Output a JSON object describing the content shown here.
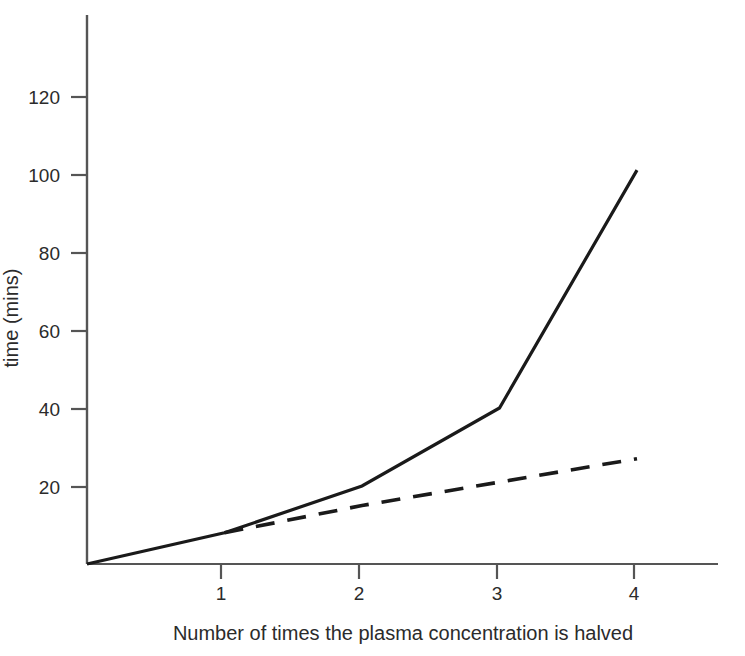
{
  "chart_data": {
    "type": "line",
    "title": "",
    "subtitle": "",
    "xlabel": "Number of times the plasma concentration is halved",
    "ylabel": "time (mins)",
    "xlim": [
      0,
      4.6
    ],
    "ylim": [
      0,
      141
    ],
    "grid": false,
    "legend": "none",
    "xticks": [
      1,
      2,
      3,
      4
    ],
    "xtick_labels": [
      "1",
      "2",
      "3",
      "4"
    ],
    "yticks": [
      20,
      40,
      60,
      80,
      100,
      120
    ],
    "ytick_labels": [
      "20",
      "40",
      "60",
      "80",
      "100",
      "120"
    ],
    "series": [
      {
        "name": "solid-curve",
        "style": "solid",
        "color": "#1a1a1a",
        "x": [
          0,
          1,
          2,
          3,
          4
        ],
        "values": [
          0,
          8,
          20,
          40,
          101
        ]
      },
      {
        "name": "dashed-curve",
        "style": "dashed",
        "color": "#1a1a1a",
        "x": [
          1,
          2,
          4
        ],
        "values": [
          8,
          15,
          27
        ]
      }
    ]
  },
  "axes": {
    "x_tick_0_label": "1",
    "x_tick_1_label": "2",
    "x_tick_2_label": "3",
    "x_tick_3_label": "4",
    "y_tick_0_label": "20",
    "y_tick_1_label": "40",
    "y_tick_2_label": "60",
    "y_tick_3_label": "80",
    "y_tick_4_label": "100",
    "y_tick_5_label": "120",
    "x_axis_title": "Number of times the plasma concentration is halved",
    "y_axis_title": "time (mins)"
  },
  "colors": {
    "background": "#ffffff",
    "axis": "#555555",
    "line": "#1a1a1a",
    "text": "#2b2b2b"
  }
}
